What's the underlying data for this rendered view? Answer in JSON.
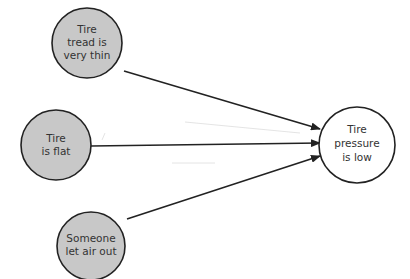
{
  "diagram": {
    "type": "cause-effect",
    "colors": {
      "cause_fill": "#c8c8c8",
      "effect_fill": "#ffffff",
      "stroke": "#222222",
      "arrow": "#222222",
      "text": "#333333"
    },
    "causes": [
      {
        "id": "tread",
        "lines": [
          "Tire",
          "tread is",
          "very thin"
        ]
      },
      {
        "id": "flat",
        "lines": [
          "Tire",
          "is flat"
        ]
      },
      {
        "id": "air",
        "lines": [
          "Someone",
          "let air out"
        ]
      }
    ],
    "effect": {
      "id": "pressure",
      "lines": [
        "Tire",
        "pressure",
        "is low"
      ]
    },
    "edges": [
      {
        "from": "tread",
        "to": "pressure"
      },
      {
        "from": "flat",
        "to": "pressure"
      },
      {
        "from": "air",
        "to": "pressure"
      }
    ]
  }
}
